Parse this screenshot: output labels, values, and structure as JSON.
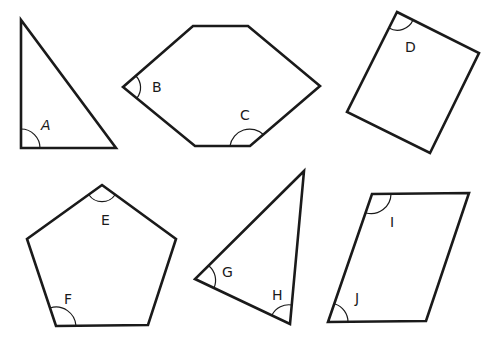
{
  "diagram": {
    "title": "",
    "stroke_color": "#1a1a1a",
    "background": "#ffffff",
    "shapes": [
      {
        "id": "triangle-1",
        "type": "right triangle",
        "points": "21,20 21,148 116,148",
        "angles": [
          {
            "label": "A",
            "vertex": [
              21,
              148
            ],
            "label_pos": [
              41,
              130
            ]
          }
        ]
      },
      {
        "id": "hexagon",
        "type": "hexagon",
        "points": "123,87 193,26 248,26 320,86 250,146 195,146",
        "angles": [
          {
            "label": "B",
            "vertex": [
              123,
              87
            ],
            "label_pos": [
              152,
              92
            ]
          },
          {
            "label": "C",
            "vertex": [
              250,
              146
            ],
            "label_pos": [
              240,
              120
            ]
          }
        ]
      },
      {
        "id": "rectangle",
        "type": "rectangle",
        "points": "397,12 479,53 430,153 347,112",
        "angles": [
          {
            "label": "D",
            "vertex": [
              397,
              12
            ],
            "label_pos": [
              405,
              52
            ]
          }
        ]
      },
      {
        "id": "pentagon",
        "type": "pentagon",
        "points": "102,185 176,239 148,325 56,326 27,239",
        "angles": [
          {
            "label": "E",
            "vertex": [
              102,
              185
            ],
            "label_pos": [
              101,
              225
            ]
          },
          {
            "label": "F",
            "vertex": [
              56,
              326
            ],
            "label_pos": [
              64,
              304
            ]
          }
        ]
      },
      {
        "id": "triangle-2",
        "type": "triangle",
        "points": "304,171 290,324 195,279",
        "angles": [
          {
            "label": "G",
            "vertex": [
              195,
              279
            ],
            "label_pos": [
              222,
              277
            ]
          },
          {
            "label": "H",
            "vertex": [
              290,
              324
            ],
            "label_pos": [
              272,
              300
            ]
          }
        ]
      },
      {
        "id": "parallelogram",
        "type": "parallelogram",
        "points": "372,194 469,193 426,321 328,322",
        "angles": [
          {
            "label": "I",
            "vertex": [
              372,
              194
            ],
            "label_pos": [
              390,
              227
            ]
          },
          {
            "label": "J",
            "vertex": [
              328,
              322
            ],
            "label_pos": [
              355,
              303
            ]
          }
        ]
      }
    ]
  }
}
